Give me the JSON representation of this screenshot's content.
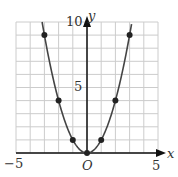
{
  "chart_data": {
    "type": "line",
    "title": "",
    "function": "y = x^2",
    "xlabel": "x",
    "ylabel": "y",
    "xlim": [
      -5,
      5
    ],
    "ylim": [
      0,
      10
    ],
    "grid": true,
    "series": [
      {
        "name": "y = x^2",
        "points": [
          [
            -3,
            9
          ],
          [
            -2,
            4
          ],
          [
            -1,
            1
          ],
          [
            0,
            0
          ],
          [
            1,
            1
          ],
          [
            2,
            4
          ],
          [
            3,
            9
          ]
        ]
      }
    ],
    "tick_labels": {
      "x_min": "−5",
      "x_max": "5",
      "y_mid": "5",
      "y_max": "10",
      "origin": "O"
    },
    "colors": {
      "curve": "#444444",
      "grid": "#cccccc",
      "axis": "#111111",
      "points": "#222222"
    }
  }
}
